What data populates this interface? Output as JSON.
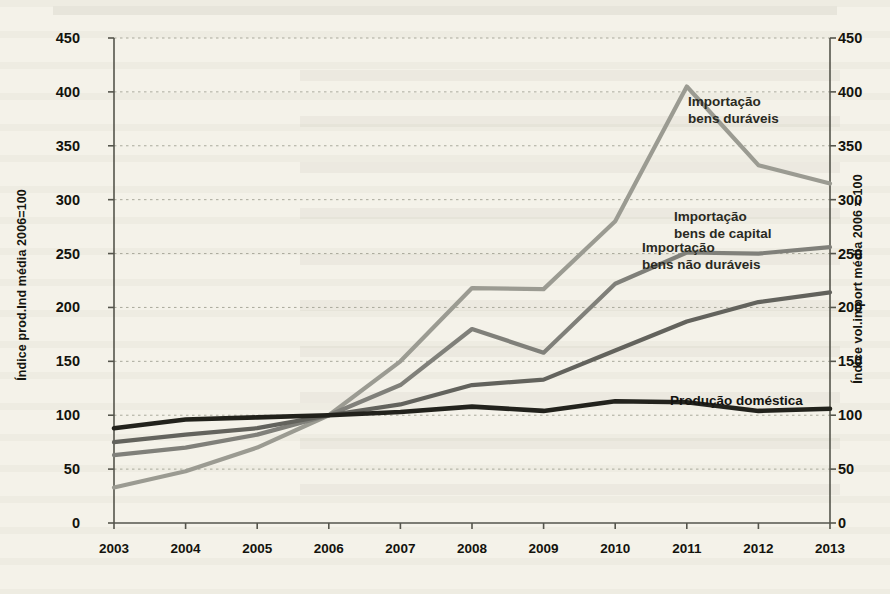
{
  "chart_data": {
    "type": "line",
    "title": "",
    "xlabel": "",
    "categories": [
      "2003",
      "2004",
      "2005",
      "2006",
      "2007",
      "2008",
      "2009",
      "2010",
      "2011",
      "2012",
      "2013"
    ],
    "ylabel_left": "Índice prod.Ind média 2006=100",
    "ylabel_right": "Índice vol.import média 2006 = 100",
    "ylim": [
      0,
      450
    ],
    "yticks": [
      0,
      50,
      100,
      150,
      200,
      250,
      300,
      350,
      400,
      450
    ],
    "ytick_labels_left": [
      "0",
      "50",
      "100",
      "150",
      "200",
      "250",
      "300",
      "350",
      "400",
      "450"
    ],
    "ytick_labels_right": [
      "0",
      "50",
      "100",
      "150",
      "200",
      "250",
      "300",
      "350",
      "400",
      "450"
    ],
    "grid": true,
    "grid_style": "dotted",
    "legend_position": "inline-annotations",
    "series": [
      {
        "name": "Importação bens duráveis",
        "color": "#9b9b92",
        "width": 4.2,
        "values": [
          33,
          48,
          70,
          100,
          150,
          218,
          217,
          280,
          405,
          332,
          315
        ]
      },
      {
        "name": "Importação bens de capital",
        "color": "#80807a",
        "width": 4.2,
        "values": [
          63,
          70,
          82,
          100,
          128,
          180,
          158,
          222,
          251,
          250,
          256
        ]
      },
      {
        "name": "Importação bens não duráveis",
        "color": "#63635d",
        "width": 4.2,
        "values": [
          75,
          82,
          88,
          100,
          110,
          128,
          133,
          160,
          187,
          205,
          214
        ]
      },
      {
        "name": "Produção doméstica",
        "color": "#22221c",
        "width": 4.6,
        "values": [
          88,
          96,
          98,
          100,
          103,
          108,
          104,
          113,
          112,
          104,
          106
        ]
      }
    ],
    "annotations": [
      {
        "id": "duraveis",
        "line1": "Importação",
        "line2": "bens duráveis"
      },
      {
        "id": "capital",
        "line1": "Importação",
        "line2": "bens de capital"
      },
      {
        "id": "nao_duraveis",
        "line1": "Importação",
        "line2": "bens não duráveis"
      },
      {
        "id": "domestica",
        "line1": "Produção doméstica",
        "line2": ""
      }
    ],
    "colors": {
      "background": "#f4f2e9",
      "axis": "#55554c",
      "grid": "#a9a99c",
      "text": "#13130d"
    }
  }
}
